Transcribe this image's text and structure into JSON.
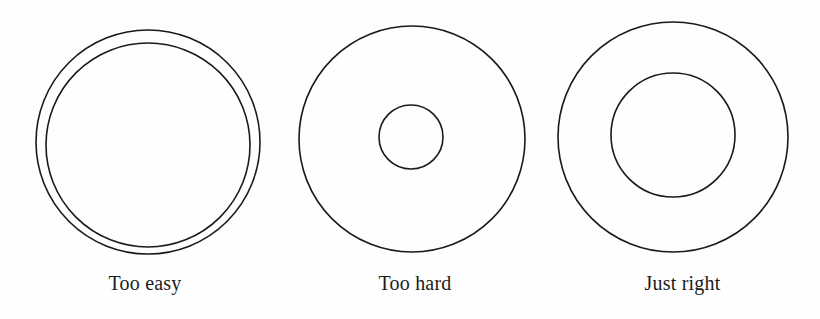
{
  "figure": {
    "type": "concentric-circle-diagram",
    "background_color": "#fefefe",
    "stroke_color": "#1a1a1a",
    "text_color": "#1c1c1c",
    "panel_count": 3,
    "panels": [
      {
        "id": "too-easy",
        "caption": "Too easy",
        "circles": [
          {
            "role": "outer",
            "cx": 148,
            "cy": 142,
            "r": 112,
            "stroke_width": 1.6
          },
          {
            "role": "inner",
            "cx": 148,
            "cy": 145,
            "r": 102,
            "stroke_width": 1.6
          }
        ],
        "inner_to_outer_ratio": 0.91
      },
      {
        "id": "too-hard",
        "caption": "Too hard",
        "circles": [
          {
            "role": "outer",
            "cx": 127,
            "cy": 139,
            "r": 113,
            "stroke_width": 1.6
          },
          {
            "role": "inner",
            "cx": 126,
            "cy": 137,
            "r": 32,
            "stroke_width": 1.6
          }
        ],
        "inner_to_outer_ratio": 0.28
      },
      {
        "id": "just-right",
        "caption": "Just right",
        "circles": [
          {
            "role": "outer",
            "cx": 128,
            "cy": 137,
            "r": 115,
            "stroke_width": 1.6
          },
          {
            "role": "inner",
            "cx": 128,
            "cy": 135,
            "r": 62,
            "stroke_width": 1.6
          }
        ],
        "inner_to_outer_ratio": 0.54
      }
    ]
  }
}
